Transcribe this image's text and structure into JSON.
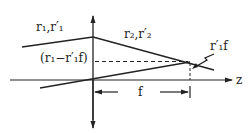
{
  "diagram": {
    "type": "thin-lens ray diagram",
    "labels": {
      "ray_in": "r₁,r′₁",
      "ray_out": "r₂,r′₂",
      "intercept": "(r₁−r′₁f)",
      "slope_offset": "r′₁f",
      "focal": "f",
      "axis": "z"
    },
    "colors": {
      "line": "#222222",
      "background": "#ffffff"
    }
  }
}
